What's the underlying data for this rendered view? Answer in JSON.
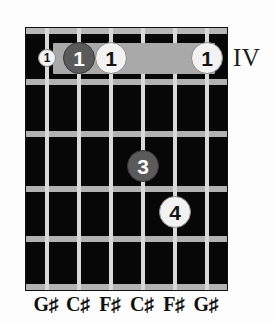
{
  "diagram": {
    "type": "guitar-chord-diagram",
    "position_numeral": "IV",
    "strings_count": 6,
    "frets_count": 5,
    "string_x": [
      21,
      53,
      85,
      117,
      149,
      181
    ],
    "fret_y": [
      6,
      51,
      103,
      158,
      208,
      256
    ],
    "barre": {
      "label": "barre",
      "fret": 1,
      "from_string": 2,
      "to_string": 6,
      "left": 27,
      "top": 15,
      "width": 162,
      "height": 31,
      "color": "#a9a9a9"
    },
    "markers": [
      {
        "name": "marker-string1-fret1",
        "label": "1",
        "string": 1,
        "fret": 1,
        "style": "light",
        "left": 12,
        "top": 21,
        "size": 18,
        "text_size": "small"
      },
      {
        "name": "marker-string2-fret1",
        "label": "1",
        "string": 2,
        "fret": 1,
        "style": "dark",
        "left": 37,
        "top": 14,
        "size": 32,
        "text_size": "big"
      },
      {
        "name": "marker-string3-fret1",
        "label": "1",
        "string": 3,
        "fret": 1,
        "style": "light",
        "left": 69,
        "top": 14,
        "size": 32,
        "text_size": "big"
      },
      {
        "name": "marker-string6-fret1",
        "label": "1",
        "string": 6,
        "fret": 1,
        "style": "light",
        "left": 165,
        "top": 14,
        "size": 32,
        "text_size": "big"
      },
      {
        "name": "marker-string4-fret3",
        "label": "3",
        "string": 4,
        "fret": 3,
        "style": "dark",
        "left": 101,
        "top": 122,
        "size": 32,
        "text_size": "big"
      },
      {
        "name": "marker-string5-fret4",
        "label": "4",
        "string": 5,
        "fret": 4,
        "style": "light",
        "left": 133,
        "top": 168,
        "size": 32,
        "text_size": "big"
      }
    ],
    "note_labels": [
      {
        "note": "G",
        "accidental": "♯",
        "x": 21
      },
      {
        "note": "C",
        "accidental": "♯",
        "x": 53
      },
      {
        "note": "F",
        "accidental": "♯",
        "x": 85
      },
      {
        "note": "C",
        "accidental": "♯",
        "x": 117
      },
      {
        "note": "F",
        "accidental": "♯",
        "x": 149
      },
      {
        "note": "G",
        "accidental": "♯",
        "x": 181
      }
    ],
    "colors": {
      "fretboard": "#070707",
      "fret": "#b2b2b2",
      "string": "#d9d9d9",
      "barre": "#a9a9a9",
      "marker_light": "#f2f2f2",
      "marker_dark": "#5a5a5a",
      "text": "#101010"
    }
  }
}
